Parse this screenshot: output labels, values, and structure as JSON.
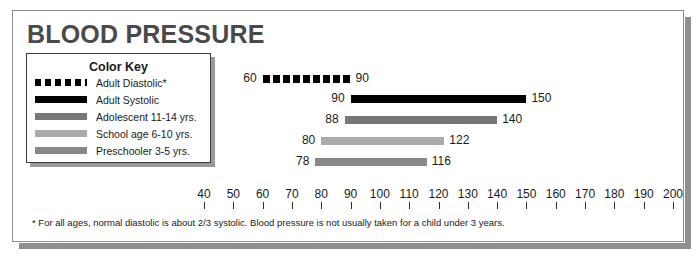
{
  "title": "BLOOD PRESSURE",
  "legend": {
    "title": "Color Key",
    "items": [
      {
        "label": "Adult Diastolic*",
        "style": "dashed",
        "color": "#000000"
      },
      {
        "label": "Adult Systolic",
        "style": "solid",
        "color": "#000000"
      },
      {
        "label": "Adolescent  11-14 yrs.",
        "style": "solid",
        "color": "#777777"
      },
      {
        "label": "School age 6-10 yrs.",
        "style": "solid",
        "color": "#aaaaaa"
      },
      {
        "label": "Preschooler 3-5 yrs.",
        "style": "solid",
        "color": "#888888"
      }
    ]
  },
  "footnote": "* For all ages, normal diastolic is about 2/3 systolic. Blood pressure is not usually taken for a child under 3 years.",
  "chart_data": {
    "type": "bar",
    "orientation": "horizontal",
    "title": "BLOOD PRESSURE",
    "xlabel": "",
    "ylabel": "",
    "xlim": [
      40,
      200
    ],
    "xticks": [
      40,
      50,
      60,
      70,
      80,
      90,
      100,
      110,
      120,
      130,
      140,
      150,
      160,
      170,
      180,
      190,
      200
    ],
    "grid": false,
    "legend_position": "top-left",
    "series": [
      {
        "name": "Adult Diastolic*",
        "start": 60,
        "end": 90,
        "start_label": "60",
        "end_label": "90",
        "color": "#000000",
        "style": "dashed"
      },
      {
        "name": "Adult Systolic",
        "start": 90,
        "end": 150,
        "start_label": "90",
        "end_label": "150",
        "color": "#000000",
        "style": "solid"
      },
      {
        "name": "Adolescent  11-14 yrs.",
        "start": 88,
        "end": 140,
        "start_label": "88",
        "end_label": "140",
        "color": "#777777",
        "style": "solid"
      },
      {
        "name": "School age 6-10 yrs.",
        "start": 80,
        "end": 122,
        "start_label": "80",
        "end_label": "122",
        "color": "#aaaaaa",
        "style": "solid"
      },
      {
        "name": "Preschooler 3-5 yrs.",
        "start": 78,
        "end": 116,
        "start_label": "78",
        "end_label": "116",
        "color": "#888888",
        "style": "solid"
      }
    ]
  }
}
